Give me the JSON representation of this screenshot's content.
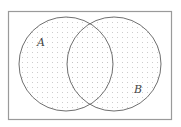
{
  "diagram": {
    "type": "venn",
    "shaded_region": "A ∪ B",
    "universal_set": {
      "x": 8,
      "y": 11,
      "width": 164,
      "height": 109,
      "stroke": "#9a9a9a"
    },
    "sets": [
      {
        "label": "A",
        "cx": 66,
        "cy": 64,
        "r": 47,
        "label_x": 41,
        "label_y": 46
      },
      {
        "label": "B",
        "cx": 114,
        "cy": 64,
        "r": 47,
        "label_x": 138,
        "label_y": 93
      }
    ],
    "circle_stroke": "#707070",
    "fill_pattern": "dots",
    "dot_color": "#c4c4c4",
    "background": "#ffffff"
  }
}
